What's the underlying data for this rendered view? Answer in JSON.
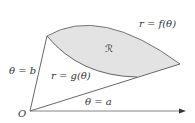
{
  "diagram": {
    "type": "polar-region",
    "labels": {
      "outer_curve": "r = f(θ)",
      "inner_curve": "r = g(θ)",
      "region": "ℛ",
      "upper_ray": "θ = b",
      "lower_ray": "θ = a",
      "origin": "O"
    },
    "colors": {
      "region_fill": "#e3e3e3",
      "stroke": "#555555",
      "text": "#333333"
    }
  }
}
